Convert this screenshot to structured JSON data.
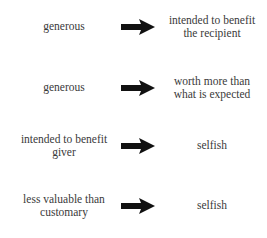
{
  "rows": [
    {
      "left": "generous",
      "right": "intended to benefit the recipient"
    },
    {
      "left": "generous",
      "right": "worth more than what is expected"
    },
    {
      "left": "intended to benefit giver",
      "right": "selfish"
    },
    {
      "left": "less valuable than customary",
      "right": "selfish"
    }
  ],
  "arrow_color": "#111111"
}
